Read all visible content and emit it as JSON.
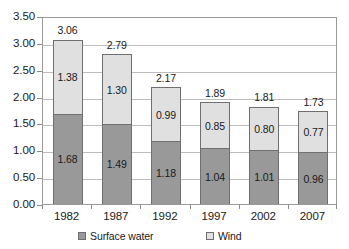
{
  "chart_data": {
    "type": "bar",
    "subtype": "stacked-bar",
    "title": "",
    "subtitle": "",
    "xlabel": "",
    "ylabel": "",
    "categories": [
      "1982",
      "1987",
      "1992",
      "1997",
      "2002",
      "2007"
    ],
    "series": [
      {
        "name": "Surface water",
        "color": "#999999",
        "values": [
          1.68,
          1.49,
          1.18,
          1.04,
          1.01,
          0.96
        ],
        "value_labels": [
          "1.68",
          "1.49",
          "1.18",
          "1.04",
          "1.01",
          "0.96"
        ]
      },
      {
        "name": "Wind",
        "color": "#E0E0E0",
        "values": [
          1.38,
          1.3,
          0.99,
          0.85,
          0.8,
          0.77
        ],
        "value_labels": [
          "1.38",
          "1.30",
          "0.99",
          "0.85",
          "0.80",
          "0.77"
        ]
      }
    ],
    "totals": [
      3.06,
      2.79,
      2.17,
      1.89,
      1.81,
      1.73
    ],
    "total_labels": [
      "3.06",
      "2.79",
      "2.17",
      "1.89",
      "1.81",
      "1.73"
    ],
    "ylim": [
      0.0,
      3.5
    ],
    "ytick_step": 0.5,
    "ytick_labels": [
      "0.00",
      "0.50",
      "1.00",
      "1.50",
      "2.00",
      "2.50",
      "3.00",
      "3.50"
    ],
    "ytick_values": [
      0.0,
      0.5,
      1.0,
      1.5,
      2.0,
      2.5,
      3.0,
      3.5
    ],
    "grid": true,
    "grid_axis": "y",
    "legend_position": "bottom",
    "legend_entries": [
      {
        "label": "Surface water",
        "color": "#999999",
        "swatch": "filled-square-icon"
      },
      {
        "label": "Wind",
        "color": "#E0E0E0",
        "swatch": "outlined-square-icon"
      }
    ],
    "colors": {
      "surface_water": "#999999",
      "wind": "#E0E0E0",
      "gridline": "#BCBCBC",
      "axis": "#9A9A9A",
      "text": "#1A1A1A",
      "plot_background": "#FFFFFF"
    }
  }
}
